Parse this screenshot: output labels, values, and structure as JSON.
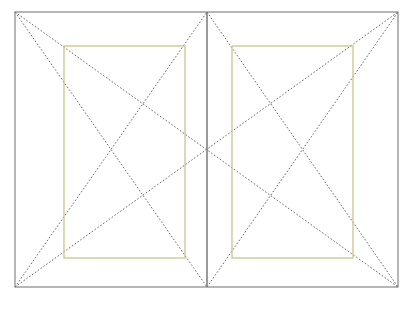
{
  "figure": {
    "kind": "page-layout-construction-diagram",
    "name": "Van de Graaf canon two-page spread",
    "background_color": "#ffffff"
  },
  "colors": {
    "page_outline": "#7a7a7a",
    "spine": "#6e6e74",
    "text_block": "#c9c68b",
    "construction_line": "#4a4a4a"
  },
  "strokes": {
    "page_outline_width": 1.1,
    "spine_width": 1.4,
    "text_block_width": 1.3,
    "construction_width": 0.85,
    "construction_dash": "1.6 1.9"
  },
  "geometry": {
    "spread": {
      "label": "spread-outline",
      "x1": 15,
      "y1": 12,
      "x2": 398,
      "y2": 287,
      "width": 383,
      "height": 275
    },
    "spine": {
      "label": "spine",
      "x": 207,
      "y1": 12,
      "y2": 287
    },
    "pages": [
      {
        "label": "verso-page",
        "x1": 15,
        "y1": 12,
        "x2": 207,
        "y2": 287
      },
      {
        "label": "recto-page",
        "x1": 207,
        "y1": 12,
        "x2": 398,
        "y2": 287
      }
    ],
    "text_blocks": [
      {
        "label": "verso-text-block",
        "x1": 64,
        "y1": 46,
        "x2": 185,
        "y2": 258,
        "width": 121,
        "height": 212
      },
      {
        "label": "recto-text-block",
        "x1": 232,
        "y1": 46,
        "x2": 353,
        "y2": 258,
        "width": 121,
        "height": 212
      }
    ],
    "construction_lines": [
      {
        "label": "spread-diagonal-tl-br",
        "x1": 15,
        "y1": 12,
        "x2": 398,
        "y2": 287
      },
      {
        "label": "spread-diagonal-bl-tr",
        "x1": 15,
        "y1": 287,
        "x2": 398,
        "y2": 12
      },
      {
        "label": "verso-diagonal-tl-br",
        "x1": 15,
        "y1": 12,
        "x2": 207,
        "y2": 287
      },
      {
        "label": "verso-diagonal-bl-tr",
        "x1": 15,
        "y1": 287,
        "x2": 207,
        "y2": 12
      },
      {
        "label": "recto-diagonal-tl-br",
        "x1": 207,
        "y1": 12,
        "x2": 398,
        "y2": 287
      },
      {
        "label": "recto-diagonal-bl-tr",
        "x1": 207,
        "y1": 287,
        "x2": 398,
        "y2": 12
      }
    ],
    "key_points": [
      {
        "label": "spread-center",
        "x": 207,
        "y": 150
      },
      {
        "label": "spine-top",
        "x": 207,
        "y": 12
      },
      {
        "label": "spine-bottom",
        "x": 207,
        "y": 287
      },
      {
        "label": "corner-top-left",
        "x": 15,
        "y": 12
      },
      {
        "label": "corner-top-right",
        "x": 398,
        "y": 12
      },
      {
        "label": "corner-bottom-left",
        "x": 15,
        "y": 287
      },
      {
        "label": "corner-bottom-right",
        "x": 398,
        "y": 287
      }
    ]
  }
}
